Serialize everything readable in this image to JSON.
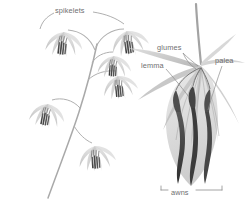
{
  "figure": {
    "kind": "botanical-illustration",
    "background_color": "#ffffff"
  },
  "labels": {
    "spikelets": "spikelets",
    "glumes": "glumes",
    "lemma": "lemma",
    "palea": "palea",
    "awns": "awns"
  },
  "colors": {
    "label_text": "#6f6f6f",
    "leader_line": "#8d8d8d",
    "stem": "#a9a9a9",
    "bract_pale": "#cfcfcf",
    "bract_mid": "#b4b4b4",
    "awn_dark": "#4a4a4a",
    "awn_darkest": "#3a3a3a"
  },
  "panels": {
    "left": {
      "name": "whole-panicle",
      "spikelet_count": 6
    },
    "right": {
      "name": "spikelet-detail",
      "parts": [
        "glumes",
        "lemma",
        "palea",
        "awns"
      ]
    }
  }
}
